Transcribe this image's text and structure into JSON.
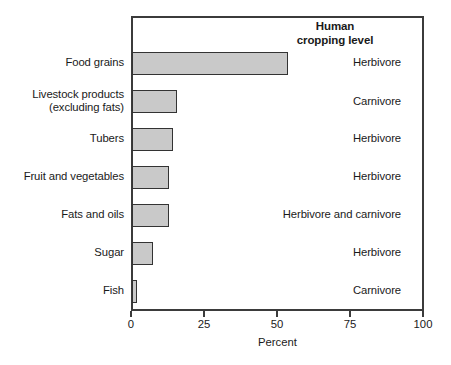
{
  "chart_data": {
    "type": "bar",
    "orientation": "horizontal",
    "title": "",
    "xlabel": "Percent",
    "ylabel": "",
    "xlim": [
      0,
      100
    ],
    "xticks": [
      0,
      25,
      50,
      75,
      100
    ],
    "xtick_labels": [
      "0",
      "25",
      "50",
      "75",
      "100"
    ],
    "grid": false,
    "legend": "none",
    "categories": [
      "Food grains",
      "Livestock products (excluding fats)",
      "Tubers",
      "Fruit and vegetables",
      "Fats and oils",
      "Sugar",
      "Fish"
    ],
    "values": [
      53.5,
      15.4,
      14.0,
      12.7,
      12.6,
      7.2,
      1.7
    ],
    "annotation_column_header": "Human cropping level",
    "annotations": [
      "Herbivore",
      "Carnivore",
      "Herbivore",
      "Herbivore",
      "Herbivore and carnivore",
      "Herbivore",
      "Carnivore"
    ],
    "bar_color": "#c9c9c9",
    "bar_edge_color": "#333333",
    "axis_color": "#3b3b3b"
  },
  "annotation_header": {
    "line1": "Human",
    "line2": "cropping level"
  },
  "category_labels": [
    {
      "line1": "Food grains",
      "line2": ""
    },
    {
      "line1": "Livestock products",
      "line2": "(excluding fats)"
    },
    {
      "line1": "Tubers",
      "line2": ""
    },
    {
      "line1": "Fruit and vegetables",
      "line2": ""
    },
    {
      "line1": "Fats and oils",
      "line2": ""
    },
    {
      "line1": "Sugar",
      "line2": ""
    },
    {
      "line1": "Fish",
      "line2": ""
    }
  ],
  "axis": {
    "x_title": "Percent",
    "tick_labels": [
      "0",
      "25",
      "50",
      "75",
      "100"
    ]
  }
}
